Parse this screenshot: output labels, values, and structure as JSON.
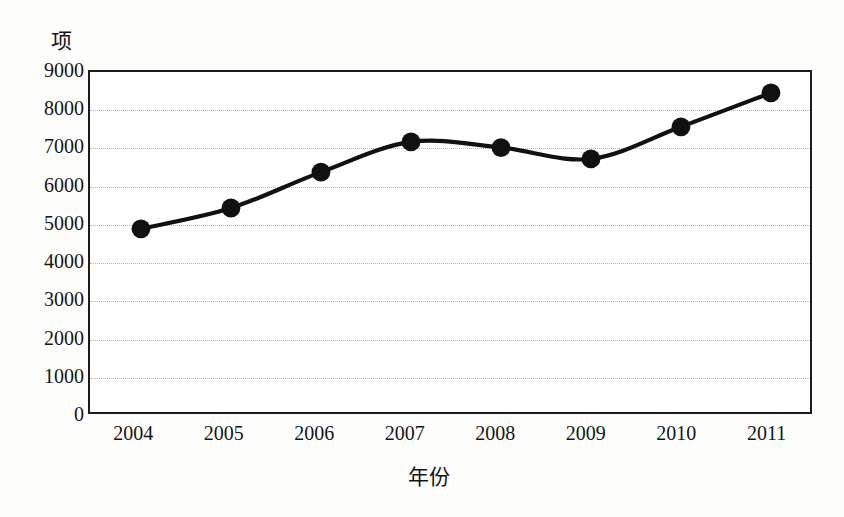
{
  "chart_data": {
    "type": "line",
    "title": "",
    "subtitle": "",
    "xlabel": "年份",
    "ylabel": "项",
    "y_unit_label": "项",
    "categories": [
      "2004",
      "2005",
      "2006",
      "2007",
      "2008",
      "2009",
      "2010",
      "2011"
    ],
    "x": [
      2004,
      2005,
      2006,
      2007,
      2008,
      2009,
      2010,
      2011
    ],
    "values": [
      4850,
      5400,
      6350,
      7150,
      7000,
      6700,
      7550,
      8450
    ],
    "series": [
      {
        "name": "项",
        "values": [
          4850,
          5400,
          6350,
          7150,
          7000,
          6700,
          7550,
          8450
        ]
      }
    ],
    "ylim": [
      0,
      9000
    ],
    "ytick_step": 1000,
    "ytick_labels": [
      "9000",
      "8000",
      "7000",
      "6000",
      "5000",
      "4000",
      "3000",
      "2000",
      "1000",
      "0"
    ],
    "ytick_values": [
      9000,
      8000,
      7000,
      6000,
      5000,
      4000,
      3000,
      2000,
      1000,
      0
    ],
    "xtick_labels": [
      "2004",
      "2005",
      "2006",
      "2007",
      "2008",
      "2009",
      "2010",
      "2011"
    ],
    "grid": true,
    "grid_style": "dotted-horizontal",
    "grid_color": "#b9b9b9",
    "legend": false,
    "legend_position": "none",
    "line_color": "#111111",
    "marker_color": "#111111",
    "marker_shape": "circle",
    "line_smoothing": "spline",
    "plot_border_color": "#1c1c1c",
    "background_color": "#ffffff",
    "annotations": []
  }
}
